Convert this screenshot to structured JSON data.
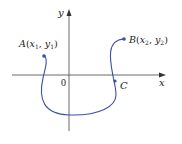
{
  "diagram": {
    "axes": {
      "x_label": "x",
      "y_label": "y",
      "origin_label": "0"
    },
    "points": [
      {
        "id": "A",
        "label": "A(x₁, y₁)",
        "name": "A",
        "coords": "(x₁, y₁)"
      },
      {
        "id": "B",
        "label": "B(x₂, y₂)",
        "name": "B",
        "coords": "(x₂, y₂)"
      },
      {
        "id": "C",
        "label": "C",
        "name": "C"
      }
    ],
    "colors": {
      "curve": "#3a4fa8",
      "axis": "#333333",
      "text": "#222222"
    }
  }
}
